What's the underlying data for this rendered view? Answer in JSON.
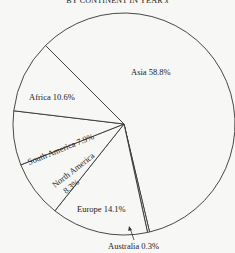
{
  "chart_data": {
    "type": "pie",
    "title": "BY CONTINENT IN YEAR x",
    "title_text": "BY CONTINENT IN YEAR",
    "title_var": "x",
    "slices": [
      {
        "label": "Asia",
        "value": 58.8,
        "text": "Asia 58.8%"
      },
      {
        "label": "Australia",
        "value": 0.3,
        "text": "Australia 0.3%"
      },
      {
        "label": "Europe",
        "value": 14.1,
        "text": "Europe 14.1%"
      },
      {
        "label": "North America",
        "value": 8.3,
        "text_lines": [
          "North America",
          "8.3%"
        ]
      },
      {
        "label": "South America",
        "value": 7.9,
        "text": "South America 7.9%"
      },
      {
        "label": "Africa",
        "value": 10.6,
        "text": "Africa 10.6%"
      }
    ],
    "unit": "%",
    "legend": "none",
    "colors": {
      "stroke": "#333333",
      "fill": "#f7f7f5"
    }
  }
}
